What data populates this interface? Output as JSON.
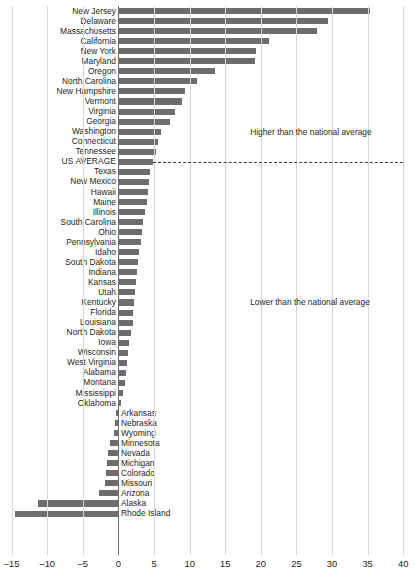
{
  "chart_data": {
    "type": "bar",
    "orientation": "horizontal",
    "title": "",
    "xlabel": "",
    "ylabel": "",
    "xlim": [
      -15,
      40
    ],
    "xticks": [
      -15,
      -10,
      -5,
      0,
      5,
      10,
      15,
      20,
      25,
      30,
      35,
      40
    ],
    "xtick_labels": [
      "–15",
      "–10",
      "–5",
      "0",
      "5",
      "10",
      "15",
      "20",
      "25",
      "30",
      "35",
      "40"
    ],
    "grid": true,
    "legend": "none",
    "reference_line": {
      "label": "US AVERAGE",
      "value": 4.9,
      "style": "dashed"
    },
    "annotations": [
      {
        "text": "Higher than the national average",
        "x": 18.5,
        "y_row": 12
      },
      {
        "text": "Lower than the national average",
        "x": 18.5,
        "y_row": 29
      }
    ],
    "categories": [
      "New Jersey",
      "Delaware",
      "Massachusetts",
      "California",
      "New York",
      "Maryland",
      "Oregon",
      "North Carolina",
      "New Hampshire",
      "Vermont",
      "Virginia",
      "Georgia",
      "Washington",
      "Connecticut",
      "Tennessee",
      "US AVERAGE",
      "Texas",
      "New Mexico",
      "Hawaii",
      "Maine",
      "Illinois",
      "South Carolina",
      "Ohio",
      "Pennsylvania",
      "Idaho",
      "South Dakota",
      "Indiana",
      "Kansas",
      "Utah",
      "Kentucky",
      "Florida",
      "Louisiana",
      "North Dakota",
      "Iowa",
      "Wisconsin",
      "West Virginia",
      "Alabama",
      "Montana",
      "Mississippi",
      "Oklahoma",
      "Arkansas",
      "Nebraska",
      "Wyoming",
      "Minnesota",
      "Nevada",
      "Michigan",
      "Colorado",
      "Missouri",
      "Arizona",
      "Alaska",
      "Rhode Island"
    ],
    "values": [
      35.3,
      29.4,
      27.9,
      21.2,
      19.3,
      19.2,
      13.6,
      11.1,
      9.3,
      8.9,
      7.9,
      7.2,
      6.0,
      5.5,
      5.3,
      4.9,
      4.5,
      4.3,
      4.2,
      4.0,
      3.7,
      3.4,
      3.3,
      3.2,
      2.9,
      2.8,
      2.6,
      2.4,
      2.3,
      2.2,
      2.1,
      2.0,
      1.7,
      1.5,
      1.3,
      1.2,
      1.0,
      0.9,
      0.6,
      0.4,
      -0.4,
      -0.5,
      -0.6,
      -1.2,
      -1.4,
      -1.6,
      -1.8,
      -1.9,
      -2.7,
      -11.3,
      -14.6
    ]
  }
}
